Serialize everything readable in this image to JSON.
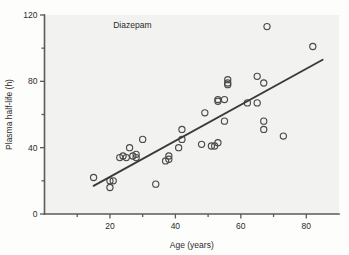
{
  "chart_data": {
    "type": "scatter",
    "title": "",
    "annotations": [
      {
        "text": "Diazepam",
        "x": 21,
        "y": 112
      }
    ],
    "xlabel": "Age (years)",
    "ylabel": "Plasma half-life (h)",
    "xlim": [
      0,
      90
    ],
    "ylim": [
      0,
      120
    ],
    "grid": false,
    "legend_position": "none",
    "xticks": [
      20,
      40,
      60,
      80
    ],
    "xtick_labels": [
      "20",
      "40",
      "60",
      "80"
    ],
    "xminorticks": [
      10,
      30,
      50,
      70
    ],
    "yticks": [
      0,
      40,
      80,
      120
    ],
    "ytick_labels": [
      "0",
      "40",
      "80",
      "120"
    ],
    "yminorticks": [
      20,
      60,
      100
    ],
    "marker": "open-circle",
    "series": [
      {
        "name": "Diazepam",
        "x": [
          15,
          20,
          20,
          21,
          23,
          24,
          25,
          26,
          27,
          28,
          28,
          30,
          34,
          37,
          38,
          38,
          41,
          42,
          42,
          48,
          49,
          51,
          52,
          53,
          53,
          53,
          55,
          55,
          56,
          56,
          56,
          62,
          65,
          65,
          67,
          67,
          67,
          68,
          73,
          82
        ],
        "y": [
          22,
          16,
          20,
          20,
          34,
          35,
          34,
          40,
          35,
          34,
          36,
          45,
          18,
          32,
          33,
          35,
          40,
          45,
          51,
          42,
          61,
          41,
          41,
          43,
          68,
          69,
          56,
          69,
          78,
          79,
          81,
          67,
          67,
          83,
          51,
          56,
          79,
          113,
          47,
          101
        ]
      }
    ],
    "fit_line": {
      "type": "linear-regression",
      "x_start": 15,
      "y_start": 17,
      "x_end": 85,
      "y_end": 93
    }
  }
}
